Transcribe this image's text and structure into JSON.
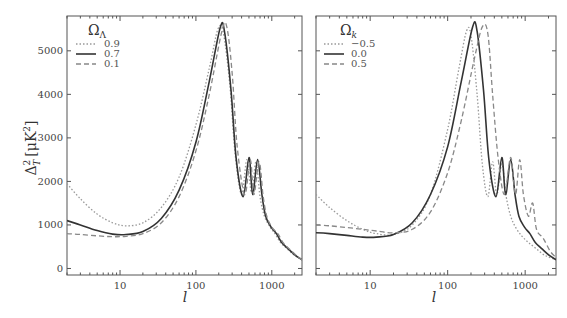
{
  "chart_data": [
    {
      "type": "line",
      "panel": "left",
      "xscale": "log",
      "xlabel": "l",
      "ylabel": "Δ_T^2 [μK^2]",
      "xlim": [
        2,
        2500
      ],
      "ylim": [
        -150,
        5800
      ],
      "xticks": [
        10,
        100,
        1000
      ],
      "xtick_labels": [
        "10",
        "100",
        "1000"
      ],
      "yticks": [
        0,
        1000,
        2000,
        3000,
        4000,
        5000
      ],
      "ytick_labels": [
        "0",
        "1000",
        "2000",
        "3000",
        "4000",
        "5000"
      ],
      "legend_title": "Ω_Λ",
      "legend_position": "upper left",
      "grid": false,
      "series": [
        {
          "name": "0.9",
          "style": "dotted",
          "x": [
            2,
            3,
            5,
            8,
            12,
            20,
            35,
            60,
            100,
            150,
            195,
            230,
            280,
            330,
            400,
            470,
            540,
            620,
            700,
            800,
            950,
            1100,
            1300,
            1600,
            2000,
            2500
          ],
          "y": [
            1950,
            1600,
            1250,
            1050,
            980,
            1050,
            1400,
            2100,
            3300,
            4600,
            5500,
            5400,
            4200,
            2600,
            1700,
            2500,
            1750,
            2450,
            1650,
            1200,
            950,
            800,
            600,
            450,
            300,
            200
          ]
        },
        {
          "name": "0.7",
          "style": "solid",
          "x": [
            2,
            3,
            5,
            8,
            12,
            20,
            35,
            60,
            100,
            150,
            210,
            240,
            290,
            340,
            420,
            500,
            560,
            650,
            740,
            830,
            980,
            1150,
            1350,
            1650,
            2050,
            2500
          ],
          "y": [
            1100,
            1000,
            870,
            790,
            780,
            850,
            1150,
            1800,
            2900,
            4300,
            5550,
            5400,
            4100,
            2500,
            1650,
            2550,
            1700,
            2500,
            1700,
            1200,
            950,
            800,
            600,
            450,
            300,
            200
          ]
        },
        {
          "name": "0.1",
          "style": "dashed",
          "x": [
            2,
            3,
            5,
            8,
            12,
            20,
            35,
            60,
            100,
            150,
            220,
            255,
            300,
            350,
            440,
            520,
            580,
            680,
            770,
            860,
            1000,
            1200,
            1400,
            1700,
            2100,
            2500
          ],
          "y": [
            800,
            780,
            750,
            730,
            740,
            800,
            1050,
            1650,
            2700,
            4000,
            5450,
            5550,
            4500,
            2800,
            1700,
            2500,
            1700,
            2450,
            1650,
            1200,
            950,
            800,
            600,
            450,
            300,
            200
          ]
        }
      ]
    },
    {
      "type": "line",
      "panel": "right",
      "xscale": "log",
      "xlabel": "l",
      "xlim": [
        2,
        2500
      ],
      "ylim": [
        -150,
        5800
      ],
      "xticks": [
        10,
        100,
        1000
      ],
      "xtick_labels": [
        "10",
        "100",
        "1000"
      ],
      "legend_title": "Ω_k",
      "legend_position": "upper left",
      "grid": false,
      "series": [
        {
          "name": "−0.5",
          "style": "dotted",
          "x": [
            2,
            3,
            5,
            8,
            12,
            20,
            35,
            60,
            100,
            140,
            175,
            200,
            240,
            280,
            330,
            380,
            430,
            500,
            570,
            650,
            750,
            900,
            1100,
            1400,
            1800,
            2500
          ],
          "y": [
            1700,
            1400,
            1100,
            900,
            800,
            780,
            1000,
            1700,
            3200,
            4600,
            5450,
            5350,
            4000,
            2400,
            1650,
            2450,
            1700,
            2400,
            1650,
            1200,
            950,
            750,
            600,
            450,
            300,
            200
          ]
        },
        {
          "name": "0.0",
          "style": "solid",
          "x": [
            2,
            3,
            5,
            8,
            12,
            20,
            35,
            60,
            100,
            150,
            210,
            240,
            290,
            340,
            420,
            500,
            560,
            650,
            740,
            830,
            980,
            1150,
            1350,
            1650,
            2050,
            2500
          ],
          "y": [
            820,
            800,
            760,
            720,
            720,
            780,
            1050,
            1700,
            2800,
            4300,
            5550,
            5450,
            4100,
            2500,
            1650,
            2550,
            1700,
            2500,
            1700,
            1200,
            950,
            800,
            600,
            450,
            300,
            200
          ]
        },
        {
          "name": "0.5",
          "style": "dashed",
          "x": [
            2,
            3,
            5,
            8,
            12,
            20,
            35,
            60,
            100,
            150,
            220,
            280,
            330,
            380,
            450,
            540,
            650,
            750,
            850,
            950,
            1100,
            1250,
            1400,
            1700,
            2100,
            2500
          ],
          "y": [
            1000,
            980,
            940,
            900,
            860,
            820,
            900,
            1300,
            2200,
            3400,
            4800,
            5550,
            5400,
            4000,
            2500,
            1700,
            2550,
            1700,
            2500,
            1700,
            1200,
            1500,
            900,
            700,
            400,
            250
          ]
        }
      ]
    }
  ],
  "axes": {
    "left": {
      "ylabel": "Δ",
      "ylabel_sub": "T",
      "ylabel_sup": "2",
      "ylabel_units": "[μK",
      "ylabel_units_sup": "2",
      "ylabel_close": "]",
      "xlabel": "l",
      "xticks": [
        "10",
        "100",
        "1000"
      ],
      "yticks": [
        "0",
        "1000",
        "2000",
        "3000",
        "4000",
        "5000"
      ]
    },
    "right": {
      "xlabel": "l",
      "xticks": [
        "10",
        "100",
        "1000"
      ]
    }
  },
  "legends": {
    "left": {
      "title": "Ω",
      "title_sub": "Λ",
      "items": [
        "0.9",
        "0.7",
        "0.1"
      ]
    },
    "right": {
      "title": "Ω",
      "title_sub": "k",
      "items": [
        "−0.5",
        "0.0",
        "0.5"
      ]
    }
  },
  "colors": {
    "solid": "#333333",
    "dotted": "#999999",
    "dashed": "#888888",
    "axis": "#555555"
  }
}
